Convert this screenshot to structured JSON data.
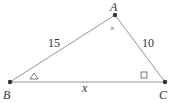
{
  "diagram": {
    "type": "triangle",
    "vertices": {
      "A": {
        "label": "A",
        "x": 115,
        "y": 15
      },
      "B": {
        "label": "B",
        "x": 10,
        "y": 82
      },
      "C": {
        "label": "C",
        "x": 165,
        "y": 82
      }
    },
    "sides": {
      "AB": {
        "label": "15"
      },
      "AC": {
        "label": "10"
      },
      "BC": {
        "label": "x"
      }
    },
    "angle_markers": {
      "A": {
        "symbol": "×"
      },
      "B": {
        "symbol": "△"
      },
      "C": {
        "symbol": "□"
      }
    },
    "colors": {
      "line": "#888888",
      "point": "#333333",
      "text": "#333333"
    }
  }
}
